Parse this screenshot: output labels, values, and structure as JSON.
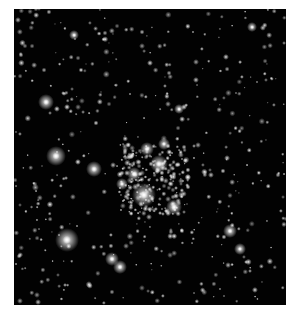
{
  "image": {
    "description": "Star cluster field, grayscale, dense bright cluster center-right",
    "background": "#020202",
    "frame_bg": "#ffffff"
  },
  "bright_stars": [
    {
      "x": 42,
      "y": 147,
      "r": 10
    },
    {
      "x": 32,
      "y": 93,
      "r": 8
    },
    {
      "x": 53,
      "y": 231,
      "r": 12
    },
    {
      "x": 130,
      "y": 186,
      "r": 12
    },
    {
      "x": 145,
      "y": 155,
      "r": 9
    },
    {
      "x": 80,
      "y": 160,
      "r": 8
    },
    {
      "x": 133,
      "y": 140,
      "r": 7
    },
    {
      "x": 120,
      "y": 165,
      "r": 7
    },
    {
      "x": 160,
      "y": 198,
      "r": 8
    },
    {
      "x": 98,
      "y": 250,
      "r": 7
    },
    {
      "x": 106,
      "y": 258,
      "r": 7
    },
    {
      "x": 60,
      "y": 26,
      "r": 5
    },
    {
      "x": 165,
      "y": 100,
      "r": 5
    },
    {
      "x": 216,
      "y": 222,
      "r": 7
    },
    {
      "x": 238,
      "y": 18,
      "r": 5
    },
    {
      "x": 150,
      "y": 135,
      "r": 6
    },
    {
      "x": 108,
      "y": 175,
      "r": 6
    },
    {
      "x": 226,
      "y": 240,
      "r": 6
    }
  ]
}
